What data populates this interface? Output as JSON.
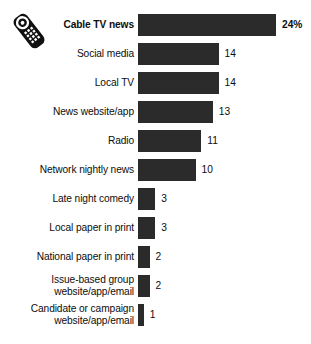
{
  "icon": {
    "name": "tv-remote-icon",
    "description": "television remote control"
  },
  "chart_data": {
    "type": "bar",
    "orientation": "horizontal",
    "title": "",
    "subtitle": "",
    "xlabel": "",
    "ylabel": "",
    "grid": false,
    "legend": false,
    "value_unit": "percent",
    "xlim": [
      0,
      24
    ],
    "categories": [
      "Cable TV news",
      "Social media",
      "Local TV",
      "News website/app",
      "Radio",
      "Network nightly news",
      "Late night comedy",
      "Local paper in print",
      "National paper in print",
      "Issue-based group\nwebsite/app/email",
      "Candidate or campaign\nwebsite/app/email"
    ],
    "values": [
      24,
      14,
      14,
      13,
      11,
      10,
      3,
      3,
      2,
      2,
      1
    ],
    "value_labels": [
      "24%",
      "14",
      "14",
      "13",
      "11",
      "10",
      "3",
      "3",
      "2",
      "2",
      "1"
    ],
    "highlight_index": 0,
    "bar_color": "#2b2b2b",
    "background_color": "#ffffff",
    "text_color": "#0d0d0d"
  }
}
